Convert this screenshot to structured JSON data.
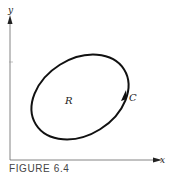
{
  "figure": {
    "caption": "FIGURE 6.4",
    "axes": {
      "x_label": "x",
      "y_label": "y"
    },
    "curve_label": "C",
    "region_label": "R",
    "colors": {
      "stroke": "#111111",
      "axis": "#555555",
      "background": "#ffffff"
    }
  }
}
